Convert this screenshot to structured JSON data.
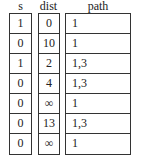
{
  "headers": {
    "s": "s",
    "dist": "dist",
    "path": "path"
  },
  "rows": [
    {
      "s": "1",
      "dist": "0",
      "path": "1"
    },
    {
      "s": "0",
      "dist": "10",
      "path": "1"
    },
    {
      "s": "1",
      "dist": "2",
      "path": "1,3"
    },
    {
      "s": "0",
      "dist": "4",
      "path": "1,3"
    },
    {
      "s": "0",
      "dist": "∞",
      "path": "1"
    },
    {
      "s": "0",
      "dist": "13",
      "path": "1,3"
    },
    {
      "s": "0",
      "dist": "∞",
      "path": "1"
    }
  ]
}
